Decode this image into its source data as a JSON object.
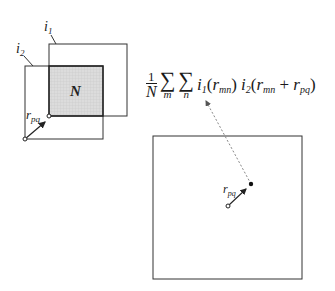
{
  "diagram": {
    "labels": {
      "image1": "i",
      "image1_sub": "1",
      "image2": "i",
      "image2_sub": "2",
      "overlap": "N",
      "shift_vector": "r",
      "shift_vector_sub": "pq",
      "shift_vector_right": "r",
      "shift_vector_right_sub": "pq"
    },
    "formula": {
      "frac_num": "1",
      "frac_den": "N",
      "sum1_symbol": "∑",
      "sum1_index": "m",
      "sum2_symbol": "∑",
      "sum2_index": "n",
      "term1_func": "i",
      "term1_sub": "1",
      "term1_open": "(",
      "term1_var": "r",
      "term1_var_sub": "mn",
      "term1_close": ")",
      "term2_func": "i",
      "term2_sub": "2",
      "term2_open": "(",
      "term2_var": "r",
      "term2_var_sub": "mn",
      "plus": " + ",
      "term2_shift": "r",
      "term2_shift_sub": "pq",
      "term2_close": ")"
    },
    "colors": {
      "line": "#333333",
      "overlap_fill": "#d9d9d9",
      "dashed": "#888888"
    }
  }
}
